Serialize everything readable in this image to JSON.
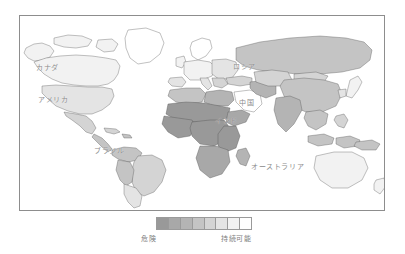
{
  "figure": {
    "background_color": "#ffffff",
    "frame_color": "#8d8d8d"
  },
  "map": {
    "projection": "equirectangular",
    "label_color": "#8a8a8a",
    "border_color": "#4a4a4a",
    "ocean_color": "#ffffff",
    "labels": [
      {
        "name": "canada",
        "text": "カナダ",
        "x": 16,
        "y": 48
      },
      {
        "name": "usa",
        "text": "アメリカ",
        "x": 18,
        "y": 80
      },
      {
        "name": "brazil",
        "text": "ブラジル",
        "x": 74,
        "y": 131
      },
      {
        "name": "russia",
        "text": "ロシア",
        "x": 213,
        "y": 47
      },
      {
        "name": "china",
        "text": "中国",
        "x": 219,
        "y": 83
      },
      {
        "name": "india",
        "text": "インド",
        "x": 195,
        "y": 101
      },
      {
        "name": "australia",
        "text": "オーストラリア",
        "x": 231,
        "y": 147
      }
    ]
  },
  "legend": {
    "name": "choropleth-legend",
    "orientation": "horizontal",
    "steps": 8,
    "colors": [
      "#999999",
      "#a8a8a8",
      "#b4b4b4",
      "#c4c4c4",
      "#d4d4d4",
      "#e4e4e4",
      "#f2f2f2",
      "#ffffff"
    ],
    "label_left": "危険",
    "label_right": "持続可能",
    "label_color": "#7e7e7e"
  },
  "chart_data": {
    "type": "heatmap",
    "title": "",
    "subtitle": "",
    "xlabel": "",
    "ylabel": "",
    "grid": false,
    "legend_position": "bottom",
    "colorbar": {
      "low_label": "危険",
      "high_label": "持続可能",
      "discrete_steps": 8,
      "colors": [
        "#999999",
        "#a8a8a8",
        "#b4b4b4",
        "#c4c4c4",
        "#d4d4d4",
        "#e4e4e4",
        "#f2f2f2",
        "#ffffff"
      ]
    },
    "categories": [
      "カナダ",
      "アメリカ",
      "ブラジル",
      "ロシア",
      "中国",
      "インド",
      "オーストラリア",
      "アフリカ",
      "ヨーロッパ",
      "東南アジア",
      "中東"
    ],
    "values": [
      8,
      6,
      5,
      4,
      4,
      3,
      6,
      2,
      6,
      4,
      3
    ],
    "value_scale": "1 = 危険 (darkest), 8 = 持続可能 (lightest)",
    "annotations": [
      "アフリカ大陸の大半は最も濃い階調（危険）",
      "北アメリカ・オーストラリアは淡い階調（持続可能寄り）",
      "ロシア・中国は中間の階調"
    ]
  }
}
